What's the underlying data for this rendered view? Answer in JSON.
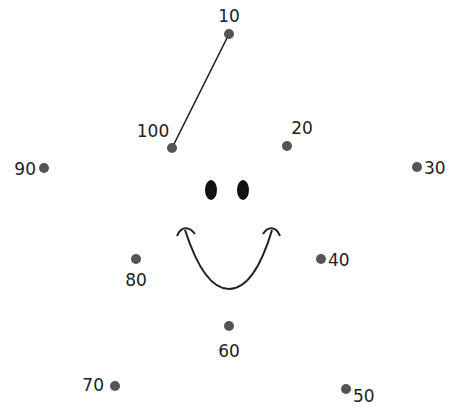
{
  "worksheet": {
    "title": "Connect the dots by tens",
    "dot_color": "#555555",
    "line_color": "#1a1a1a",
    "points": [
      {
        "label": "10",
        "x": 229,
        "y": 34,
        "lx": 229,
        "ly": 22,
        "anchor": "middle"
      },
      {
        "label": "20",
        "x": 287,
        "y": 146,
        "lx": 302,
        "ly": 134,
        "anchor": "middle"
      },
      {
        "label": "30",
        "x": 417,
        "y": 167,
        "lx": 424,
        "ly": 174,
        "anchor": "start"
      },
      {
        "label": "40",
        "x": 321,
        "y": 259,
        "lx": 328,
        "ly": 266,
        "anchor": "start"
      },
      {
        "label": "50",
        "x": 346,
        "y": 389,
        "lx": 353,
        "ly": 402,
        "anchor": "start"
      },
      {
        "label": "60",
        "x": 229,
        "y": 326,
        "lx": 229,
        "ly": 357,
        "anchor": "middle"
      },
      {
        "label": "70",
        "x": 115,
        "y": 386,
        "lx": 104,
        "ly": 391,
        "anchor": "end"
      },
      {
        "label": "80",
        "x": 136,
        "y": 259,
        "lx": 136,
        "ly": 286,
        "anchor": "middle"
      },
      {
        "label": "90",
        "x": 44,
        "y": 168,
        "lx": 36,
        "ly": 175,
        "anchor": "end"
      },
      {
        "label": "100",
        "x": 172,
        "y": 148,
        "lx": 153,
        "ly": 137,
        "anchor": "middle"
      }
    ],
    "connected_segments": [
      {
        "from": "100",
        "to": "10"
      }
    ],
    "face": {
      "left_eye": {
        "cx": 211,
        "cy": 190,
        "rx": 6,
        "ry": 10
      },
      "right_eye": {
        "cx": 243,
        "cy": 190,
        "rx": 6,
        "ry": 10
      },
      "mouth_color": "#222222"
    }
  }
}
